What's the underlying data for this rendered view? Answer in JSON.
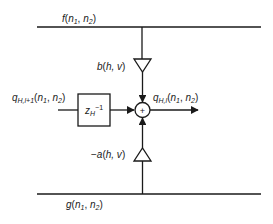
{
  "diagram": {
    "type": "signal-flow block diagram",
    "stroke_color": "#1a1a1a",
    "background": "#ffffff",
    "nodes": {
      "top_signal": {
        "name": "f",
        "sub1": "1",
        "sub2": "2",
        "var": "n"
      },
      "bottom_signal": {
        "name": "g",
        "sub1": "1",
        "sub2": "2",
        "var": "n"
      },
      "gain_top": {
        "label": "b(h, v)",
        "fn": "b",
        "args": "h, v",
        "shape": "triangle-down"
      },
      "gain_bottom": {
        "label": "-a(h, v)",
        "prefix": "−",
        "fn": "a",
        "args": "h, v",
        "shape": "triangle-up"
      },
      "delay": {
        "base": "z",
        "sub": "H",
        "sup": "−1",
        "shape": "rectangle"
      },
      "summer": {
        "symbol": "+",
        "shape": "circle"
      },
      "input": {
        "name": "q",
        "sub": "H,l+1",
        "args_var": "n",
        "a1": "1",
        "a2": "2"
      },
      "output": {
        "name": "q",
        "sub": "H,l",
        "args_var": "n",
        "a1": "1",
        "a2": "2"
      }
    },
    "edges": [
      {
        "from": "top_signal",
        "to": "gain_top"
      },
      {
        "from": "gain_top",
        "to": "summer"
      },
      {
        "from": "bottom_signal",
        "to": "gain_bottom"
      },
      {
        "from": "gain_bottom",
        "to": "summer"
      },
      {
        "from": "input",
        "to": "delay"
      },
      {
        "from": "delay",
        "to": "summer"
      },
      {
        "from": "summer",
        "to": "output"
      }
    ]
  }
}
